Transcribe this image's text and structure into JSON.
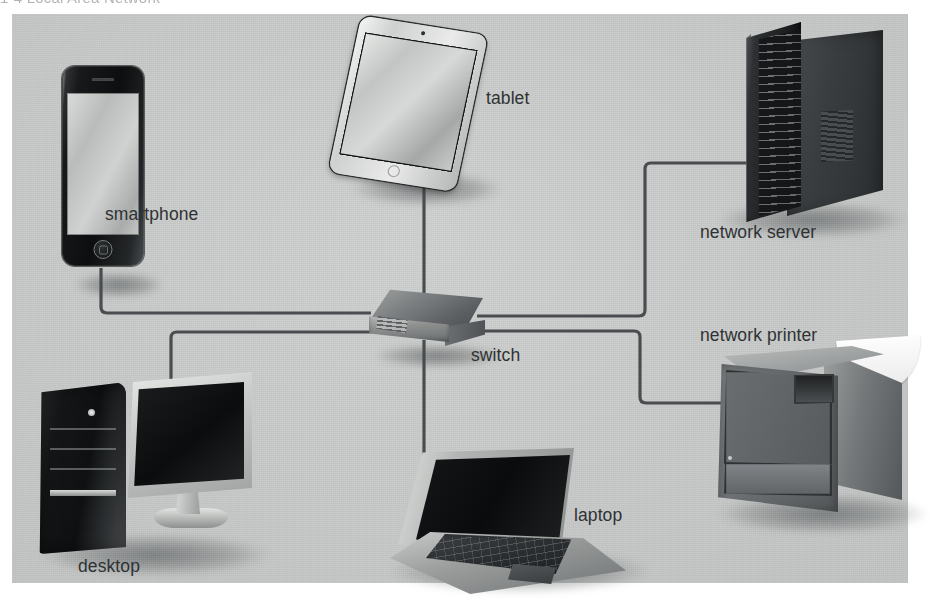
{
  "figure": {
    "caption": "1-4  Local Area Network"
  },
  "diagram": {
    "type": "network-topology",
    "central_node": "switch",
    "background_color": "#c6c8c7",
    "cable_color": "#4a4d4f",
    "label_color": "#2f3234",
    "nodes": [
      {
        "id": "smartphone",
        "label": "smartphone",
        "x": 103,
        "y": 166
      },
      {
        "id": "tablet",
        "label": "tablet",
        "x": 410,
        "y": 105
      },
      {
        "id": "network-server",
        "label": "network server",
        "x": 815,
        "y": 122
      },
      {
        "id": "network-printer",
        "label": "network printer",
        "x": 817,
        "y": 429
      },
      {
        "id": "switch",
        "label": "switch",
        "x": 426,
        "y": 322
      },
      {
        "id": "desktop",
        "label": "desktop",
        "x": 145,
        "y": 464
      },
      {
        "id": "laptop",
        "label": "laptop",
        "x": 515,
        "y": 523
      }
    ],
    "links": [
      {
        "from": "smartphone",
        "to": "switch",
        "path": "M101,268 L101,307 Q101,313 107,313 L371,313"
      },
      {
        "from": "desktop",
        "to": "switch",
        "path": "M171,392 L171,338 Q171,332 177,332 L370,332"
      },
      {
        "from": "tablet",
        "to": "switch",
        "path": "M424,170 L424,300"
      },
      {
        "from": "laptop",
        "to": "switch",
        "path": "M424,340 L424,470"
      },
      {
        "from": "network-server",
        "to": "switch",
        "path": "M477,316 L639,316 Q645,316 645,310 L645,169 Q645,163 651,163 L760,163"
      },
      {
        "from": "network-printer",
        "to": "switch",
        "path": "M477,331 L634,331 Q640,331 640,337 L640,397 Q640,403 646,403 L740,403"
      }
    ]
  }
}
